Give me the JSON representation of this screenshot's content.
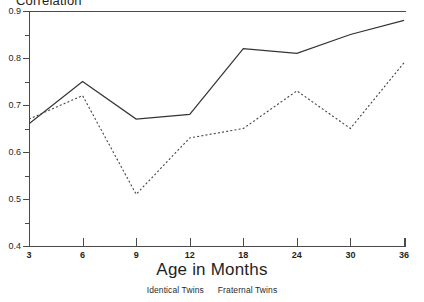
{
  "chart_data": {
    "type": "line",
    "title": "Correlation",
    "xlabel": "Age in Months",
    "ylabel": "",
    "categories": [
      "3",
      "6",
      "9",
      "12",
      "18",
      "24",
      "30",
      "36"
    ],
    "ylim": [
      0.4,
      0.9
    ],
    "yticks": [
      "0.4",
      "0.5",
      "0.6",
      "0.7",
      "0.8",
      "0.9"
    ],
    "ytick_values": [
      0.4,
      0.5,
      0.6,
      0.7,
      0.8,
      0.9
    ],
    "yminor_ticks": [
      0.45,
      0.55,
      0.65,
      0.75,
      0.85
    ],
    "grid": false,
    "legend_position": "bottom",
    "series": [
      {
        "name": "Identical Twins",
        "style": "solid",
        "color": "#333333",
        "values": [
          0.66,
          0.75,
          0.67,
          0.68,
          0.82,
          0.81,
          0.85,
          0.88
        ]
      },
      {
        "name": "Fraternal Twins",
        "style": "dotted",
        "color": "#444444",
        "values": [
          0.67,
          0.72,
          0.51,
          0.63,
          0.65,
          0.73,
          0.65,
          0.79
        ]
      }
    ]
  },
  "axis": {
    "frame_color": "#4a4a4a"
  }
}
